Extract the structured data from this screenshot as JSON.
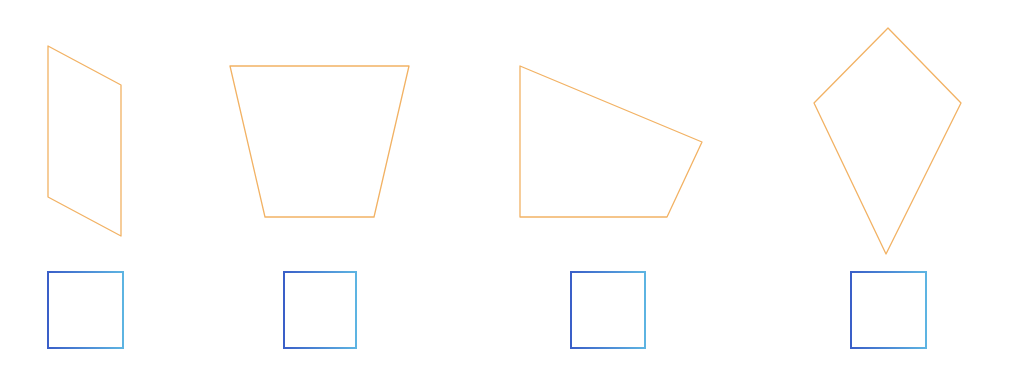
{
  "canvas": {
    "width": 1020,
    "height": 366,
    "background": "#ffffff"
  },
  "colors": {
    "shape_stroke": "#f2b264",
    "option_stroke_left": "#3a5fc8",
    "option_stroke_right": "#5db4e2"
  },
  "shapes": [
    {
      "id": "shape-1",
      "kind": "parallelogram",
      "points": [
        [
          48,
          46
        ],
        [
          121,
          85
        ],
        [
          121,
          236
        ],
        [
          48,
          197
        ]
      ]
    },
    {
      "id": "shape-2",
      "kind": "trapezoid",
      "points": [
        [
          230,
          66
        ],
        [
          409,
          66
        ],
        [
          374,
          217
        ],
        [
          265,
          217
        ]
      ]
    },
    {
      "id": "shape-3",
      "kind": "right-trapezoid",
      "points": [
        [
          520,
          66
        ],
        [
          702,
          142
        ],
        [
          667,
          217
        ],
        [
          520,
          217
        ]
      ]
    },
    {
      "id": "shape-4",
      "kind": "kite",
      "points": [
        [
          888,
          28
        ],
        [
          961,
          103
        ],
        [
          886,
          254
        ],
        [
          814,
          103
        ]
      ]
    }
  ],
  "option_boxes": [
    {
      "id": "option-1",
      "x": 48,
      "y": 272,
      "w": 75,
      "h": 76
    },
    {
      "id": "option-2",
      "x": 284,
      "y": 272,
      "w": 72,
      "h": 76
    },
    {
      "id": "option-3",
      "x": 571,
      "y": 272,
      "w": 74,
      "h": 76
    },
    {
      "id": "option-4",
      "x": 851,
      "y": 272,
      "w": 75,
      "h": 76
    }
  ]
}
